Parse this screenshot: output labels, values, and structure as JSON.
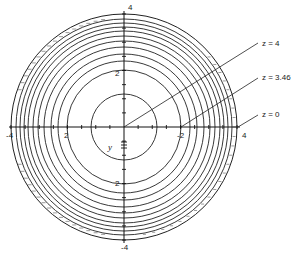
{
  "diagram": {
    "center": {
      "x": 124,
      "y": 127
    },
    "outer_radius": 113,
    "contour_radii": [
      33,
      57,
      66,
      73,
      80,
      86,
      91,
      96,
      100,
      104,
      108
    ],
    "axes": {
      "horizontal_labels": [
        {
          "text": "-4",
          "x": 6,
          "y": 138
        },
        {
          "text": "2",
          "x": 64,
          "y": 138
        },
        {
          "text": "-2",
          "x": 177,
          "y": 138
        },
        {
          "text": "4",
          "x": 242,
          "y": 138
        }
      ],
      "vertical_labels": [
        {
          "text": "4",
          "x": 128,
          "y": 10
        },
        {
          "text": "2",
          "x": 115,
          "y": 76
        },
        {
          "text": "2",
          "x": 115,
          "y": 186
        },
        {
          "text": "-4",
          "x": 121,
          "y": 250
        }
      ],
      "axis_variable": "y"
    },
    "annotations": [
      {
        "text": "z = 4",
        "x": 262,
        "y": 46,
        "from": [
          124,
          127
        ],
        "to": [
          258,
          43
        ]
      },
      {
        "text": "z = 3.46",
        "x": 262,
        "y": 80,
        "from": [
          181,
          127
        ],
        "to": [
          258,
          78
        ]
      },
      {
        "text": "z = 0",
        "x": 262,
        "y": 117,
        "from": [
          238,
          127
        ],
        "to": [
          258,
          115
        ]
      }
    ]
  }
}
